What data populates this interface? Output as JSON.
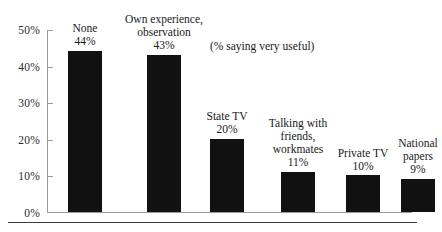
{
  "chart_data": {
    "type": "bar",
    "title": "",
    "subtitle": "",
    "annotation": "(% saying very useful)",
    "xlabel": "",
    "ylabel": "",
    "ylim": [
      0,
      50
    ],
    "grid": false,
    "legend": false,
    "value_suffix": "%",
    "categories": [
      "None",
      "Own experience, observation",
      "State TV",
      "Talking with friends, workmates",
      "Private TV",
      "National papers"
    ],
    "values": [
      44,
      43,
      20,
      11,
      10,
      9
    ],
    "value_labels": [
      "44%",
      "43%",
      "20%",
      "11%",
      "10%",
      "9%"
    ],
    "ytick_labels": [
      "50%",
      "40%",
      "30%",
      "20%",
      "10%",
      "0%"
    ],
    "ytick_values": [
      50,
      40,
      30,
      20,
      10,
      0
    ],
    "bar_color": "#111111",
    "axis_color": "#9a9a9a",
    "text_color": "#1a1a1a"
  }
}
